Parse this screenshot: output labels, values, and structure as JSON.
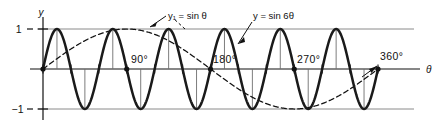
{
  "figure": {
    "kind": "math-graph",
    "axes": {
      "y_axis_label": "y",
      "x_axis_label": "θ",
      "y_ticks": [
        "1",
        "−1"
      ],
      "x_ticks": [
        "90°",
        "180°",
        "270°",
        "360°"
      ]
    },
    "annotations": [
      {
        "name": "curve-label-sin-theta",
        "text": "y₁ = sin θ"
      },
      {
        "name": "curve-label-sin-6theta",
        "text": "y = sin 6θ"
      }
    ],
    "colors": {
      "curve": "#1a1a1a",
      "guide": "#8a8a8a",
      "ordinate": "#6e6e6e",
      "ink": "#111111",
      "background": "#ffffff"
    }
  },
  "chart_data": {
    "type": "line",
    "title": "",
    "xlabel": "θ",
    "ylabel": "y",
    "xlim": [
      0,
      360
    ],
    "ylim": [
      -1,
      1
    ],
    "xticks": [
      0,
      90,
      180,
      270,
      360
    ],
    "xticklabels": [
      "",
      "90°",
      "180°",
      "270°",
      "360°"
    ],
    "yticks": [
      -1,
      1
    ],
    "yticklabels": [
      "−1",
      "1"
    ],
    "grid": false,
    "guide_lines_y": [
      1,
      -1
    ],
    "axis_markers_deg": [
      0,
      90,
      180,
      270,
      360
    ],
    "minor_ticks_deg": [
      30,
      60,
      120,
      150,
      210,
      240,
      300,
      330
    ],
    "series": [
      {
        "name": "y₁ = sin θ",
        "style": "dashed",
        "amplitude": 1,
        "frequency": 1,
        "label": "y₁ = sin θ",
        "peaks_deg": [
          90
        ],
        "troughs_deg": [
          270
        ],
        "zeros_deg": [
          0,
          180,
          360
        ]
      },
      {
        "name": "y = sin 6θ",
        "style": "solid-heavy",
        "amplitude": 1,
        "frequency": 6,
        "label": "y = sin 6θ",
        "peaks_deg": [
          15,
          75,
          135,
          195,
          255,
          315
        ],
        "troughs_deg": [
          45,
          105,
          165,
          225,
          285,
          345
        ],
        "zeros_deg": [
          0,
          30,
          60,
          90,
          120,
          150,
          180,
          210,
          240,
          270,
          300,
          330,
          360
        ]
      }
    ]
  }
}
